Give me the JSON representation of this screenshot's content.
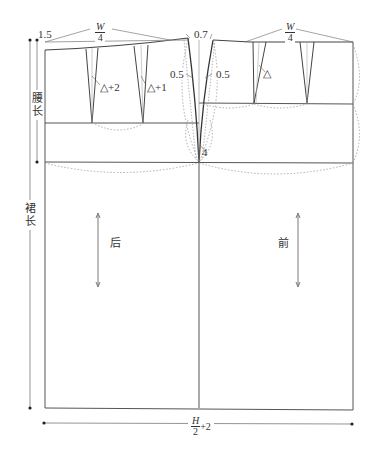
{
  "diagram": {
    "panels": {
      "back": {
        "label": "后"
      },
      "front": {
        "label": "前"
      }
    },
    "waist_labels": {
      "back": {
        "numerator": "W",
        "denominator": "4"
      },
      "front": {
        "numerator": "W",
        "denominator": "4"
      }
    },
    "measurements": {
      "back_waist_raise": "1.5",
      "side_raise": "0.7",
      "back_side_curve": "0.5",
      "front_side_curve": "0.5",
      "hip_side_gap": "4"
    },
    "darts": {
      "back_dart_1": "△+2",
      "back_dart_2": "△+1",
      "front_dart_1": "△"
    },
    "vertical_dimensions": {
      "waist_to_hip": "腰长",
      "skirt_length": "裙长"
    },
    "horizontal_dimension": {
      "numerator": "H",
      "denominator": "2",
      "suffix": "+2"
    },
    "colors": {
      "line": "#444444",
      "dotted": "#9a9a9a",
      "text": "#333333",
      "background": "#ffffff"
    }
  }
}
